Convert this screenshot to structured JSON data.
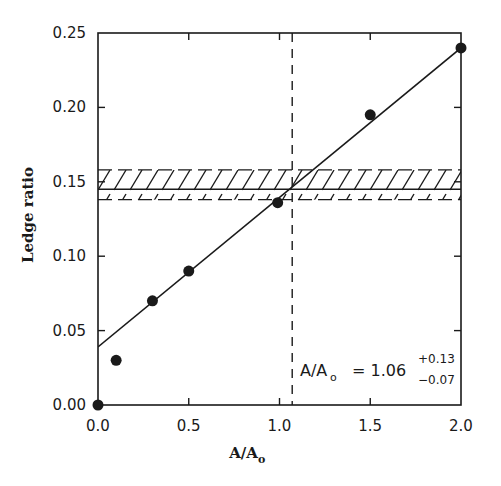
{
  "chart_data": {
    "type": "scatter",
    "title": "",
    "xlabel": "A/A",
    "xlabel_subscript": "o",
    "ylabel": "Ledge ratio",
    "xlim": [
      0.0,
      2.0
    ],
    "ylim": [
      0.0,
      0.25
    ],
    "x_ticks": [
      0.0,
      0.5,
      1.0,
      1.5,
      2.0
    ],
    "x_tick_labels": [
      "0.0",
      "0.5",
      "1.0",
      "1.5",
      "2.0"
    ],
    "y_ticks": [
      0.0,
      0.05,
      0.1,
      0.15,
      0.2,
      0.25
    ],
    "y_tick_labels": [
      "0.00",
      "0.05",
      "0.10",
      "0.15",
      "0.20",
      "0.25"
    ],
    "grid": false,
    "legend": null,
    "series": [
      {
        "name": "measured ledge ratio",
        "kind": "points",
        "marker": "filled-circle",
        "x": [
          0.0,
          0.1,
          0.3,
          0.5,
          0.99,
          1.5,
          2.0
        ],
        "y": [
          0.0,
          0.03,
          0.07,
          0.09,
          0.136,
          0.195,
          0.24
        ]
      },
      {
        "name": "linear fit",
        "kind": "line",
        "x": [
          0.0,
          2.0
        ],
        "y": [
          0.039,
          0.24
        ]
      }
    ],
    "reference_band": {
      "name": "hatched band",
      "center": 0.145,
      "lower": 0.138,
      "upper": 0.158,
      "pattern": "diagonal-hatch"
    },
    "vertical_reference": {
      "name": "dashed intersection line",
      "x": 1.07,
      "style": "dashed"
    },
    "annotations": [
      {
        "text_main": "A/A",
        "text_sub": "o",
        "text_value": "= 1.06",
        "plus_error": "+0.13",
        "minus_error": "−0.07",
        "x": 1.1,
        "y": 0.02
      }
    ],
    "colors": {
      "ink": "#1a1a1a",
      "background": "#ffffff"
    }
  }
}
